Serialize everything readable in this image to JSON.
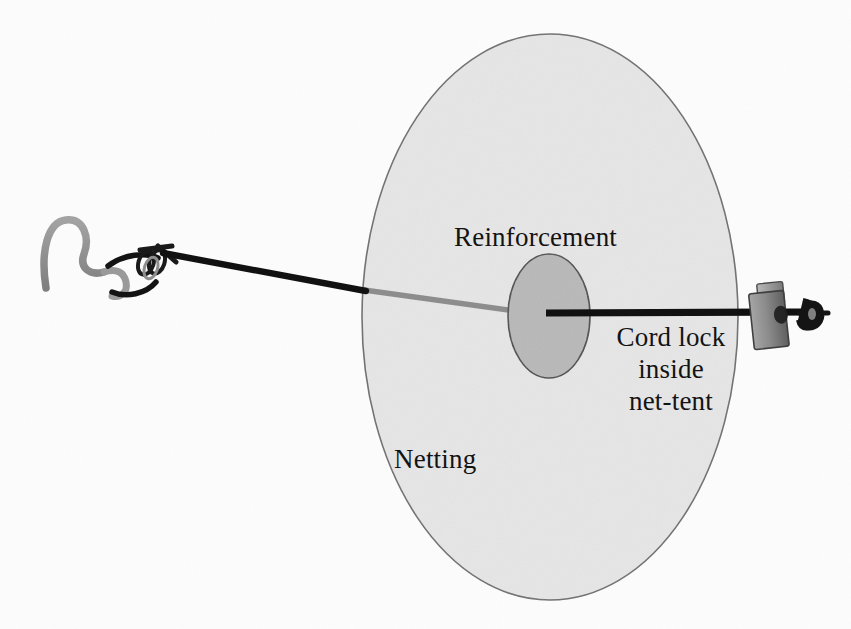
{
  "figure": {
    "background_color": "#fdfdfd"
  },
  "labels": {
    "reinforcement": "Reinforcement",
    "netting": "Netting",
    "cord_lock_line1": "Cord lock",
    "cord_lock_line2": "inside",
    "cord_lock_line3": "net-tent"
  },
  "colors": {
    "netting_fill": "#e6e6e6",
    "netting_stroke": "#6e6e6e",
    "reinforcement_fill": "#b8b8b8",
    "reinforcement_stroke": "#4f4f4f",
    "cord_dark": "#111111",
    "cord_behind_net": "#8f8f8f",
    "hardware_gray": "#8c8c8c",
    "hardware_gray_dark": "#6a6a6a",
    "hardware_gray_light": "#b2b2b2",
    "text": "#131313"
  },
  "parts": {
    "netting_ellipse": {
      "name": "Netting",
      "cx": 550,
      "cy": 317,
      "rx": 188,
      "ry": 283
    },
    "reinforcement_ellipse": {
      "name": "Reinforcement",
      "cx": 549,
      "cy": 316,
      "rx": 41,
      "ry": 62
    },
    "s_hook": {
      "name": "S-hook",
      "x": 42,
      "y": 214
    },
    "left_knot": {
      "name": "Knot at hook",
      "x": 150,
      "y": 252
    },
    "cord_left_segment": {
      "name": "Cord outside netting (left)",
      "from_x": 165,
      "from_y": 253,
      "to_x": 364,
      "to_y": 290
    },
    "cord_behind_net_segment": {
      "name": "Cord seen through netting",
      "from_x": 364,
      "from_y": 290,
      "to_x": 512,
      "to_y": 311
    },
    "cord_right_segment": {
      "name": "Cord outside netting (right)",
      "from_x": 546,
      "from_y": 313,
      "to_x": 806,
      "to_y": 313
    },
    "cord_lock": {
      "name": "Cord lock",
      "x": 752,
      "y": 286,
      "width": 34,
      "height": 60
    },
    "end_knot": {
      "name": "Stopper knot",
      "x": 802,
      "y": 301
    }
  }
}
